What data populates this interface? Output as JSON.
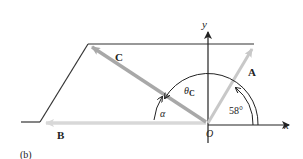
{
  "figure": {
    "panel_label": "(b)",
    "axes": {
      "x_label": "x",
      "y_label": "y",
      "origin_label": "O"
    },
    "vectors": [
      {
        "name": "A",
        "label": "A",
        "color": "#c8c8c8"
      },
      {
        "name": "B",
        "label": "B",
        "color": "#d8d8d8"
      },
      {
        "name": "C",
        "label": "C",
        "color": "#a8a8a8"
      }
    ],
    "angles": {
      "theta_c": {
        "symbol": "θ",
        "subscript": "C"
      },
      "alpha": {
        "symbol": "α"
      },
      "angle_a": {
        "value": "58°"
      }
    },
    "colors": {
      "line": "#333333",
      "axis": "#222222",
      "vector_a": "#c8c8c8",
      "vector_b": "#d8d8d8",
      "vector_c": "#a8a8a8"
    }
  }
}
